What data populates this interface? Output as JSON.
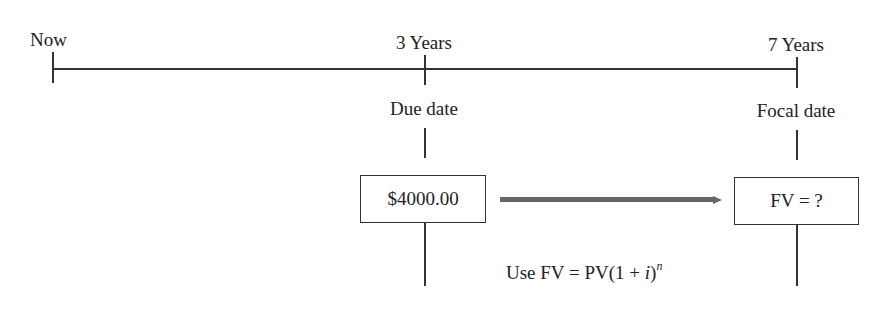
{
  "timeline": {
    "points": [
      {
        "label": "Now"
      },
      {
        "label": "3 Years",
        "sublabel": "Due date"
      },
      {
        "label": "7 Years",
        "sublabel": "Focal date"
      }
    ]
  },
  "boxes": {
    "present_value": "$4000.00",
    "future_value": "FV = ?"
  },
  "formula": {
    "prefix": "Use FV = PV(1 + ",
    "var_i": "i",
    "suffix": ")",
    "exponent": "n"
  },
  "colors": {
    "line": "#333333",
    "arrow": "#666666"
  }
}
